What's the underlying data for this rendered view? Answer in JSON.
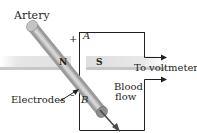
{
  "diagram": {
    "labels": {
      "artery": "Artery",
      "electrodes": "Electrodes",
      "blood_flow_line1": "Blood",
      "blood_flow_line2": "flow",
      "to_voltmeter": "To voltmeter",
      "electrode_a": "A",
      "electrode_b": "B",
      "plus": "+",
      "minus": "–",
      "north_pole": "N",
      "south_pole": "S"
    },
    "colors": {
      "line": "#231f20",
      "magnet_light": "#e8e8e8",
      "magnet_dark": "#b9b9b9",
      "artery_light": "#c8c8c8",
      "artery_dark": "#7a7a7a"
    }
  }
}
